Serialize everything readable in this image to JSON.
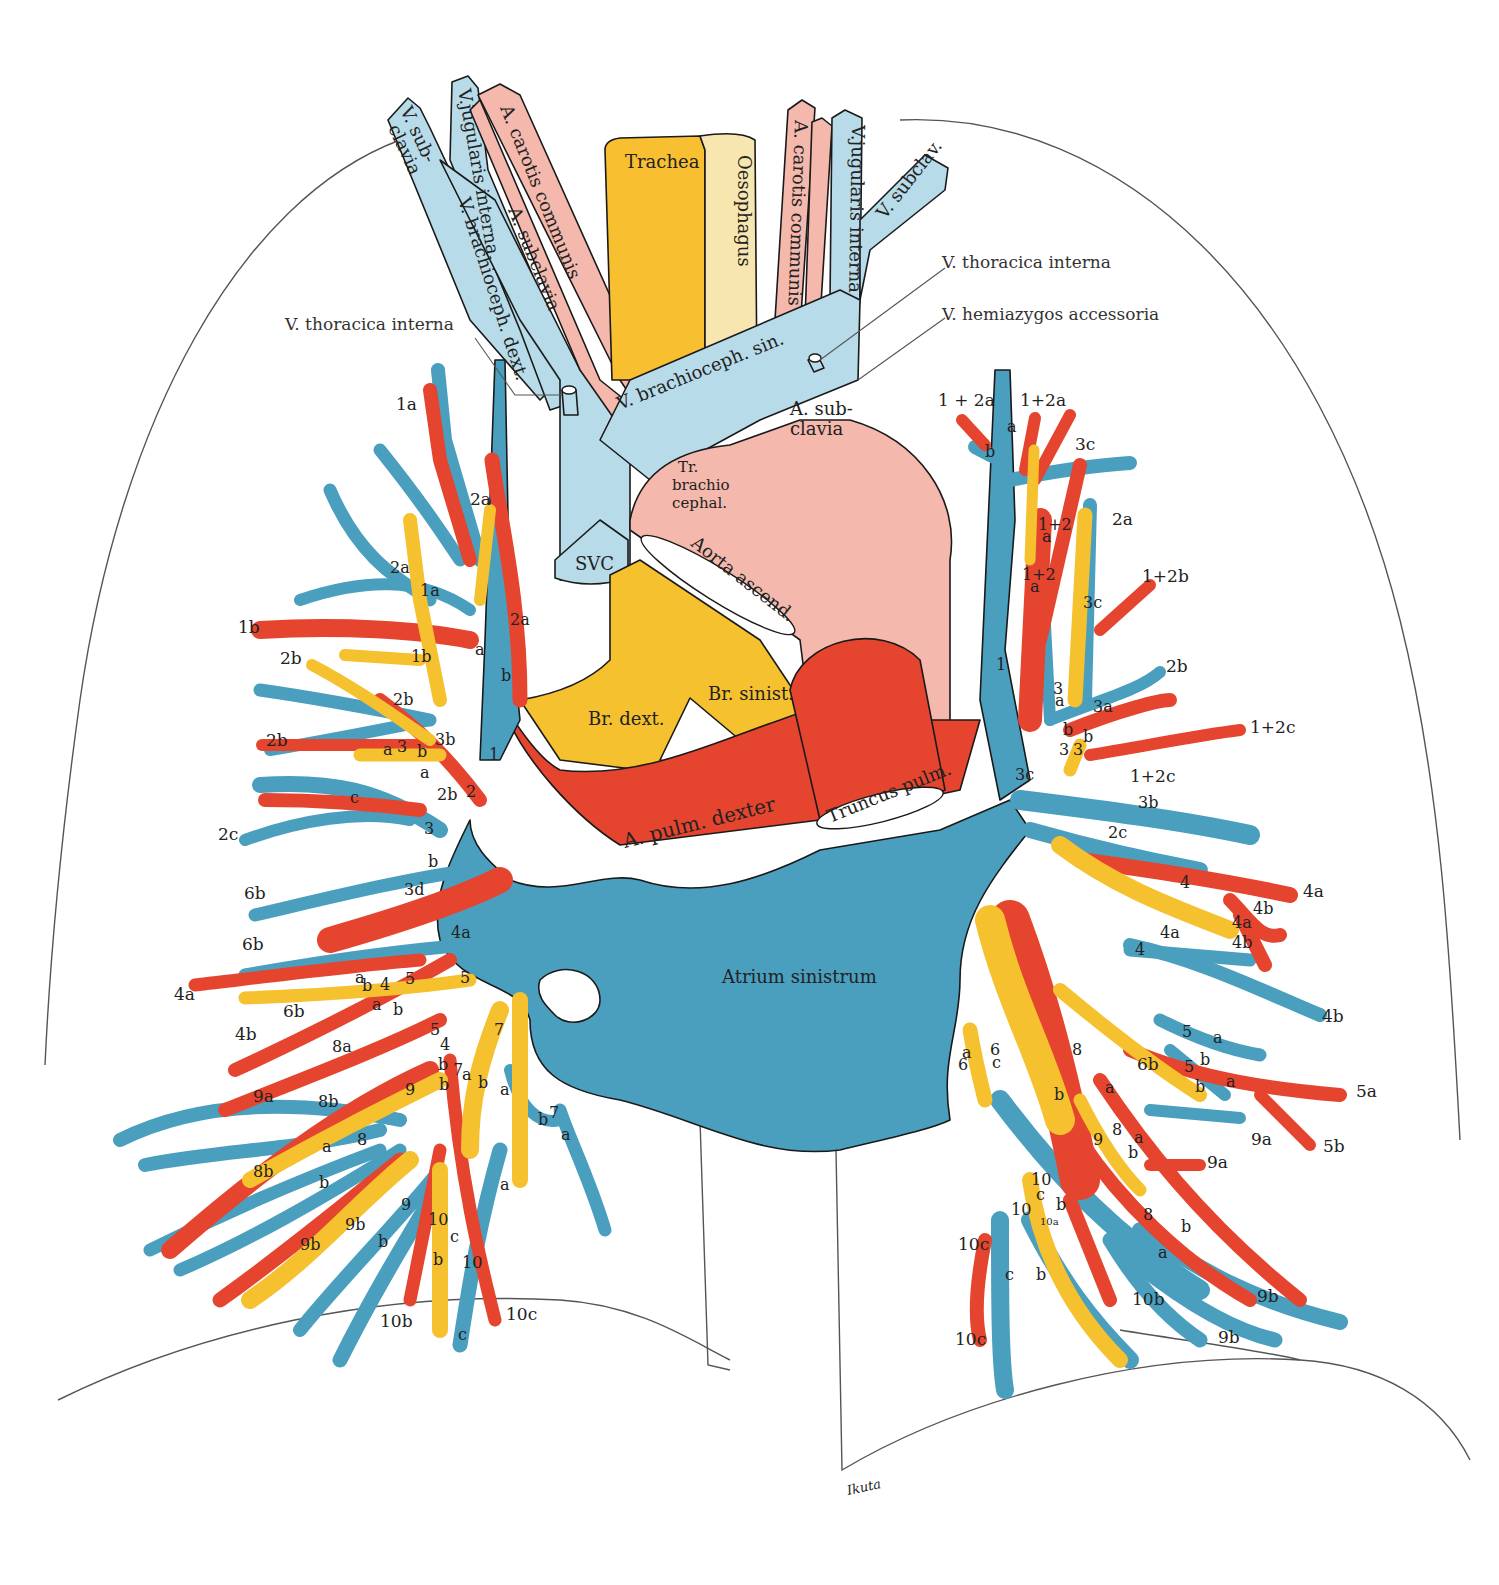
{
  "colors": {
    "vein_systemic": "#b8dbe9",
    "artery_systemic": "#f4b8ad",
    "trachea": "#f8c030",
    "oesophagus": "#f8e6b0",
    "pulmonary_vein": "#4a9fbf",
    "pulmonary_artery": "#e5442e",
    "bronchus": "#f6c12f",
    "outline": "#555555"
  },
  "neck_structures": {
    "v_subclavia_right": "V. sub-",
    "v_subclavia_right_2": "clavia",
    "v_jugularis_interna_right": "V.jugularis interna",
    "a_carotis_communis_right": "A. carotis communis",
    "a_subclavia_right": "A. subclavia",
    "v_brachioceph_dext": "V. brachioceph. dext.",
    "trachea": "Trachea",
    "oesophagus": "Oesophagus",
    "a_carotis_communis_left": "A. carotis communis",
    "v_jugularis_interna_left": "V.jugularis interna",
    "v_subclav_left": "V. subclav.",
    "v_brachioceph_sin": "V. brachioceph. sin."
  },
  "callouts": {
    "v_thoracica_interna_right": "V. thoracica  interna",
    "v_thoracica_interna_left": "V. thoracica  interna",
    "v_hemiazygos_accessoria": "V. hemiazygos  accessoria"
  },
  "heart_structures": {
    "a_subclavia_left_1": "A. sub-",
    "a_subclavia_left_2": "clavia",
    "tr_brachiocephal_1": "Tr.",
    "tr_brachiocephal_2": "brachio",
    "tr_brachiocephal_3": "cephal.",
    "svc": "SVC",
    "aorta_ascend": "Aorta ascend.",
    "br_dext": "Br. dext.",
    "br_sinist": "Br. sinist.",
    "a_pulm_dexter": "A. pulm. dexter",
    "truncus_pulm": "Truncus pulm.",
    "atrium_sinistrum": "Atrium sinistrum"
  },
  "right_lung_labels": [
    {
      "text": "1a",
      "x": 396,
      "y": 410,
      "cls": "out"
    },
    {
      "text": "2a",
      "x": 470,
      "y": 505,
      "cls": "out"
    },
    {
      "text": "2a",
      "x": 390,
      "y": 573,
      "cls": "in"
    },
    {
      "text": "1a",
      "x": 420,
      "y": 596,
      "cls": "in"
    },
    {
      "text": "2a",
      "x": 510,
      "y": 625,
      "cls": "in"
    },
    {
      "text": "1b",
      "x": 238,
      "y": 633,
      "cls": "out"
    },
    {
      "text": "2b",
      "x": 280,
      "y": 664,
      "cls": "out"
    },
    {
      "text": "1b",
      "x": 411,
      "y": 662,
      "cls": "in"
    },
    {
      "text": "a",
      "x": 475,
      "y": 655,
      "cls": "in"
    },
    {
      "text": "b",
      "x": 501,
      "y": 681,
      "cls": "in"
    },
    {
      "text": "2b",
      "x": 393,
      "y": 705,
      "cls": "in"
    },
    {
      "text": "2b",
      "x": 266,
      "y": 746,
      "cls": "out"
    },
    {
      "text": "3b",
      "x": 435,
      "y": 745,
      "cls": "in"
    },
    {
      "text": "a",
      "x": 383,
      "y": 755,
      "cls": "in"
    },
    {
      "text": "3",
      "x": 397,
      "y": 752,
      "cls": "in"
    },
    {
      "text": "b",
      "x": 417,
      "y": 757,
      "cls": "in"
    },
    {
      "text": "1",
      "x": 489,
      "y": 760,
      "cls": "in"
    },
    {
      "text": "a",
      "x": 420,
      "y": 778,
      "cls": "in"
    },
    {
      "text": "2b",
      "x": 437,
      "y": 800,
      "cls": "in"
    },
    {
      "text": "2",
      "x": 466,
      "y": 797,
      "cls": "in"
    },
    {
      "text": "c",
      "x": 350,
      "y": 803,
      "cls": "in"
    },
    {
      "text": "2c",
      "x": 218,
      "y": 840,
      "cls": "out"
    },
    {
      "text": "3",
      "x": 424,
      "y": 834,
      "cls": "in"
    },
    {
      "text": "b",
      "x": 428,
      "y": 867,
      "cls": "in"
    },
    {
      "text": "3d",
      "x": 404,
      "y": 895,
      "cls": "in"
    },
    {
      "text": "6b",
      "x": 244,
      "y": 899,
      "cls": "out"
    },
    {
      "text": "4a",
      "x": 451,
      "y": 938,
      "cls": "in"
    },
    {
      "text": "6b",
      "x": 242,
      "y": 950,
      "cls": "out"
    },
    {
      "text": "a",
      "x": 355,
      "y": 983,
      "cls": "in"
    },
    {
      "text": "b",
      "x": 362,
      "y": 991,
      "cls": "in"
    },
    {
      "text": "4",
      "x": 380,
      "y": 990,
      "cls": "in"
    },
    {
      "text": "5",
      "x": 405,
      "y": 984,
      "cls": "in"
    },
    {
      "text": "5",
      "x": 460,
      "y": 983,
      "cls": "in"
    },
    {
      "text": "4a",
      "x": 174,
      "y": 1000,
      "cls": "out"
    },
    {
      "text": "6b",
      "x": 283,
      "y": 1017,
      "cls": "out"
    },
    {
      "text": "a",
      "x": 372,
      "y": 1010,
      "cls": "in"
    },
    {
      "text": "b",
      "x": 393,
      "y": 1015,
      "cls": "in"
    },
    {
      "text": "5",
      "x": 430,
      "y": 1035,
      "cls": "in"
    },
    {
      "text": "4b",
      "x": 235,
      "y": 1040,
      "cls": "out"
    },
    {
      "text": "8a",
      "x": 332,
      "y": 1052,
      "cls": "in"
    },
    {
      "text": "4",
      "x": 440,
      "y": 1050,
      "cls": "in"
    },
    {
      "text": "b",
      "x": 438,
      "y": 1070,
      "cls": "in"
    },
    {
      "text": "7",
      "x": 494,
      "y": 1035,
      "cls": "in"
    },
    {
      "text": "7",
      "x": 453,
      "y": 1075,
      "cls": "in"
    },
    {
      "text": "a",
      "x": 462,
      "y": 1080,
      "cls": "in"
    },
    {
      "text": "b",
      "x": 478,
      "y": 1088,
      "cls": "in"
    },
    {
      "text": "a",
      "x": 500,
      "y": 1095,
      "cls": "in"
    },
    {
      "text": "b",
      "x": 439,
      "y": 1090,
      "cls": "in"
    },
    {
      "text": "9",
      "x": 405,
      "y": 1095,
      "cls": "in"
    },
    {
      "text": "9a",
      "x": 253,
      "y": 1102,
      "cls": "out"
    },
    {
      "text": "8b",
      "x": 318,
      "y": 1107,
      "cls": "in"
    },
    {
      "text": "b",
      "x": 538,
      "y": 1125,
      "cls": "in"
    },
    {
      "text": "7",
      "x": 549,
      "y": 1118,
      "cls": "in"
    },
    {
      "text": "a",
      "x": 561,
      "y": 1140,
      "cls": "in"
    },
    {
      "text": "8",
      "x": 357,
      "y": 1145,
      "cls": "in"
    },
    {
      "text": "a",
      "x": 322,
      "y": 1152,
      "cls": "in"
    },
    {
      "text": "8b",
      "x": 253,
      "y": 1177,
      "cls": "in"
    },
    {
      "text": "b",
      "x": 319,
      "y": 1188,
      "cls": "in"
    },
    {
      "text": "9",
      "x": 401,
      "y": 1210,
      "cls": "in"
    },
    {
      "text": "9b",
      "x": 345,
      "y": 1230,
      "cls": "in"
    },
    {
      "text": "10",
      "x": 428,
      "y": 1225,
      "cls": "in"
    },
    {
      "text": "a",
      "x": 500,
      "y": 1190,
      "cls": "in"
    },
    {
      "text": "9b",
      "x": 300,
      "y": 1250,
      "cls": "in"
    },
    {
      "text": "b",
      "x": 378,
      "y": 1247,
      "cls": "in"
    },
    {
      "text": "c",
      "x": 450,
      "y": 1242,
      "cls": "in"
    },
    {
      "text": "b",
      "x": 433,
      "y": 1265,
      "cls": "in"
    },
    {
      "text": "10",
      "x": 462,
      "y": 1268,
      "cls": "in"
    },
    {
      "text": "10c",
      "x": 506,
      "y": 1320,
      "cls": "out"
    },
    {
      "text": "10b",
      "x": 380,
      "y": 1327,
      "cls": "out"
    },
    {
      "text": "c",
      "x": 458,
      "y": 1340,
      "cls": "in"
    }
  ],
  "left_lung_labels": [
    {
      "text": "1 + 2a",
      "x": 938,
      "y": 406,
      "cls": "out"
    },
    {
      "text": "1+2a",
      "x": 1020,
      "y": 406,
      "cls": "out"
    },
    {
      "text": "a",
      "x": 1007,
      "y": 432,
      "cls": "in"
    },
    {
      "text": "b",
      "x": 985,
      "y": 457,
      "cls": "in"
    },
    {
      "text": "3c",
      "x": 1075,
      "y": 450,
      "cls": "out"
    },
    {
      "text": "1+2",
      "x": 1038,
      "y": 530,
      "cls": "in"
    },
    {
      "text": "a",
      "x": 1042,
      "y": 542,
      "cls": "in"
    },
    {
      "text": "2a",
      "x": 1112,
      "y": 525,
      "cls": "out"
    },
    {
      "text": "1+2",
      "x": 1022,
      "y": 580,
      "cls": "in"
    },
    {
      "text": "a",
      "x": 1030,
      "y": 592,
      "cls": "in"
    },
    {
      "text": "1+2b",
      "x": 1142,
      "y": 582,
      "cls": "out"
    },
    {
      "text": "3c",
      "x": 1083,
      "y": 608,
      "cls": "in"
    },
    {
      "text": "1",
      "x": 996,
      "y": 670,
      "cls": "in"
    },
    {
      "text": "2b",
      "x": 1166,
      "y": 672,
      "cls": "out"
    },
    {
      "text": "3",
      "x": 1053,
      "y": 694,
      "cls": "in"
    },
    {
      "text": "a",
      "x": 1055,
      "y": 706,
      "cls": "in"
    },
    {
      "text": "3a",
      "x": 1093,
      "y": 712,
      "cls": "in"
    },
    {
      "text": "1+2c",
      "x": 1250,
      "y": 733,
      "cls": "out"
    },
    {
      "text": "b",
      "x": 1063,
      "y": 735,
      "cls": "in"
    },
    {
      "text": "3",
      "x": 1059,
      "y": 755,
      "cls": "in"
    },
    {
      "text": "3",
      "x": 1073,
      "y": 755,
      "cls": "in"
    },
    {
      "text": "b",
      "x": 1083,
      "y": 742,
      "cls": "in"
    },
    {
      "text": "3c",
      "x": 1015,
      "y": 780,
      "cls": "in"
    },
    {
      "text": "1+2c",
      "x": 1130,
      "y": 782,
      "cls": "out"
    },
    {
      "text": "3b",
      "x": 1138,
      "y": 808,
      "cls": "in"
    },
    {
      "text": "2c",
      "x": 1108,
      "y": 838,
      "cls": "in"
    },
    {
      "text": "4",
      "x": 1180,
      "y": 888,
      "cls": "in"
    },
    {
      "text": "4a",
      "x": 1303,
      "y": 897,
      "cls": "out"
    },
    {
      "text": "4b",
      "x": 1253,
      "y": 914,
      "cls": "in"
    },
    {
      "text": "4a",
      "x": 1232,
      "y": 928,
      "cls": "in"
    },
    {
      "text": "4a",
      "x": 1160,
      "y": 938,
      "cls": "in"
    },
    {
      "text": "4b",
      "x": 1232,
      "y": 948,
      "cls": "in"
    },
    {
      "text": "4",
      "x": 1135,
      "y": 955,
      "cls": "in"
    },
    {
      "text": "4b",
      "x": 1322,
      "y": 1022,
      "cls": "out"
    },
    {
      "text": "5",
      "x": 1182,
      "y": 1037,
      "cls": "in"
    },
    {
      "text": "a",
      "x": 1213,
      "y": 1043,
      "cls": "in"
    },
    {
      "text": "b",
      "x": 1200,
      "y": 1065,
      "cls": "in"
    },
    {
      "text": "a",
      "x": 962,
      "y": 1058,
      "cls": "in"
    },
    {
      "text": "6",
      "x": 958,
      "y": 1070,
      "cls": "in"
    },
    {
      "text": "6",
      "x": 990,
      "y": 1055,
      "cls": "in"
    },
    {
      "text": "c",
      "x": 992,
      "y": 1068,
      "cls": "in"
    },
    {
      "text": "8",
      "x": 1072,
      "y": 1055,
      "cls": "in"
    },
    {
      "text": "6b",
      "x": 1137,
      "y": 1070,
      "cls": "out"
    },
    {
      "text": "5",
      "x": 1184,
      "y": 1072,
      "cls": "in"
    },
    {
      "text": "b",
      "x": 1195,
      "y": 1092,
      "cls": "in"
    },
    {
      "text": "a",
      "x": 1226,
      "y": 1087,
      "cls": "in"
    },
    {
      "text": "5a",
      "x": 1356,
      "y": 1097,
      "cls": "out"
    },
    {
      "text": "b",
      "x": 1054,
      "y": 1100,
      "cls": "in"
    },
    {
      "text": "a",
      "x": 1105,
      "y": 1093,
      "cls": "in"
    },
    {
      "text": "9",
      "x": 1093,
      "y": 1145,
      "cls": "in"
    },
    {
      "text": "8",
      "x": 1112,
      "y": 1135,
      "cls": "in"
    },
    {
      "text": "b",
      "x": 1128,
      "y": 1158,
      "cls": "in"
    },
    {
      "text": "a",
      "x": 1134,
      "y": 1143,
      "cls": "in"
    },
    {
      "text": "9a",
      "x": 1251,
      "y": 1145,
      "cls": "out"
    },
    {
      "text": "5b",
      "x": 1323,
      "y": 1152,
      "cls": "out"
    },
    {
      "text": "9a",
      "x": 1207,
      "y": 1168,
      "cls": "out"
    },
    {
      "text": "10",
      "x": 1031,
      "y": 1185,
      "cls": "in"
    },
    {
      "text": "c",
      "x": 1036,
      "y": 1200,
      "cls": "in"
    },
    {
      "text": "b",
      "x": 1056,
      "y": 1210,
      "cls": "in"
    },
    {
      "text": "10",
      "x": 1011,
      "y": 1215,
      "cls": "in"
    },
    {
      "text": "10a",
      "x": 1040,
      "y": 1225,
      "cls": "tiny"
    },
    {
      "text": "8",
      "x": 1143,
      "y": 1220,
      "cls": "in"
    },
    {
      "text": "b",
      "x": 1181,
      "y": 1232,
      "cls": "in"
    },
    {
      "text": "a",
      "x": 1158,
      "y": 1258,
      "cls": "in"
    },
    {
      "text": "10c",
      "x": 958,
      "y": 1250,
      "cls": "out"
    },
    {
      "text": "c",
      "x": 1005,
      "y": 1280,
      "cls": "in"
    },
    {
      "text": "b",
      "x": 1036,
      "y": 1280,
      "cls": "in"
    },
    {
      "text": "10b",
      "x": 1132,
      "y": 1305,
      "cls": "out"
    },
    {
      "text": "9b",
      "x": 1257,
      "y": 1302,
      "cls": "out"
    },
    {
      "text": "9b",
      "x": 1218,
      "y": 1343,
      "cls": "out"
    },
    {
      "text": "10c",
      "x": 955,
      "y": 1345,
      "cls": "out"
    }
  ],
  "signature": "Ikuta"
}
